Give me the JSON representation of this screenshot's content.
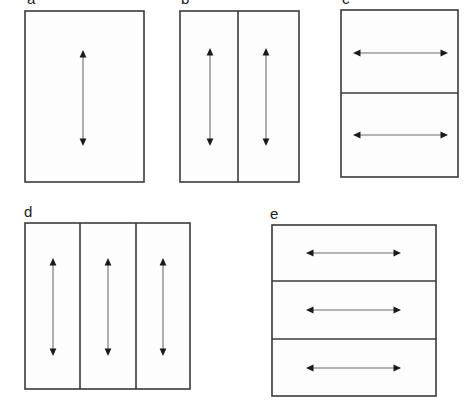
{
  "figure": {
    "width": 467,
    "height": 411,
    "background_color": "#ffffff",
    "outline_color": "#3a3a3a",
    "fill_color": "#fdfdfd",
    "arrow_line_color": "#6d6d6d",
    "arrow_head_color": "#1a1a1a",
    "label_color": "#1a1a1a"
  },
  "panels": [
    {
      "id": "a",
      "label": "a",
      "label_x": 27,
      "label_y": 4,
      "label_clipped": true,
      "rect": {
        "x": 25,
        "y": 11,
        "w": 119,
        "h": 171
      },
      "subdivision": "none",
      "divider_count": 0,
      "dividers": [],
      "arrow_orientation": "vertical",
      "arrow_count": 1,
      "arrows": [
        {
          "x1": 83,
          "y1": 50,
          "x2": 83,
          "y2": 146
        }
      ]
    },
    {
      "id": "b",
      "label": "b",
      "label_x": 181,
      "label_y": 4,
      "label_clipped": true,
      "rect": {
        "x": 180,
        "y": 11,
        "w": 119,
        "h": 171
      },
      "subdivision": "vertical",
      "divider_count": 1,
      "dividers": [
        {
          "x1": 238,
          "y1": 11,
          "x2": 238,
          "y2": 182
        }
      ],
      "arrow_orientation": "vertical",
      "arrow_count": 2,
      "arrows": [
        {
          "x1": 210,
          "y1": 48,
          "x2": 210,
          "y2": 146
        },
        {
          "x1": 266,
          "y1": 48,
          "x2": 266,
          "y2": 146
        }
      ]
    },
    {
      "id": "c",
      "label": "c",
      "label_x": 342,
      "label_y": 4,
      "label_clipped": true,
      "rect": {
        "x": 341,
        "y": 10,
        "w": 117,
        "h": 167
      },
      "subdivision": "horizontal",
      "divider_count": 1,
      "dividers": [
        {
          "x1": 341,
          "y1": 93,
          "x2": 458,
          "y2": 93
        }
      ],
      "arrow_orientation": "horizontal",
      "arrow_count": 2,
      "arrows": [
        {
          "x1": 353,
          "y1": 53,
          "x2": 448,
          "y2": 53
        },
        {
          "x1": 353,
          "y1": 135,
          "x2": 448,
          "y2": 135
        }
      ]
    },
    {
      "id": "d",
      "label": "d",
      "label_x": 24,
      "label_y": 217,
      "label_clipped": false,
      "rect": {
        "x": 25,
        "y": 223,
        "w": 165,
        "h": 166
      },
      "subdivision": "vertical",
      "divider_count": 2,
      "dividers": [
        {
          "x1": 80,
          "y1": 223,
          "x2": 80,
          "y2": 389
        },
        {
          "x1": 136,
          "y1": 223,
          "x2": 136,
          "y2": 389
        }
      ],
      "arrow_orientation": "vertical",
      "arrow_count": 3,
      "arrows": [
        {
          "x1": 53,
          "y1": 258,
          "x2": 53,
          "y2": 356
        },
        {
          "x1": 108,
          "y1": 258,
          "x2": 108,
          "y2": 356
        },
        {
          "x1": 163,
          "y1": 258,
          "x2": 163,
          "y2": 356
        }
      ]
    },
    {
      "id": "e",
      "label": "e",
      "label_x": 270,
      "label_y": 219,
      "label_clipped": false,
      "rect": {
        "x": 272,
        "y": 225,
        "w": 164,
        "h": 171
      },
      "subdivision": "horizontal",
      "divider_count": 2,
      "dividers": [
        {
          "x1": 272,
          "y1": 281,
          "x2": 436,
          "y2": 281
        },
        {
          "x1": 272,
          "y1": 339,
          "x2": 436,
          "y2": 339
        }
      ],
      "arrow_orientation": "horizontal",
      "arrow_count": 3,
      "arrows": [
        {
          "x1": 306,
          "y1": 253,
          "x2": 401,
          "y2": 253
        },
        {
          "x1": 306,
          "y1": 310,
          "x2": 401,
          "y2": 310
        },
        {
          "x1": 306,
          "y1": 368,
          "x2": 401,
          "y2": 368
        }
      ]
    }
  ]
}
